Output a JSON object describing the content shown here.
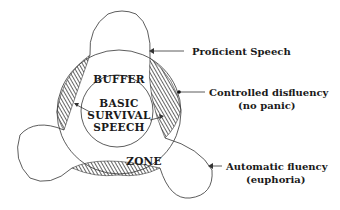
{
  "diagram": {
    "center_label": [
      "BASIC",
      "SURVIVAL",
      "SPEECH"
    ],
    "buffer_label": "BUFFER",
    "zone_label": "ZONE",
    "callouts": {
      "proficient": [
        "Proficient Speech"
      ],
      "controlled": [
        "Controlled disfluency",
        "(no panic)"
      ],
      "automatic": [
        "Automatic fluency",
        "(euphoria)"
      ]
    },
    "colors": {
      "ink": "#1a1a1a",
      "hatch": "#333333",
      "background": "#ffffff"
    }
  }
}
